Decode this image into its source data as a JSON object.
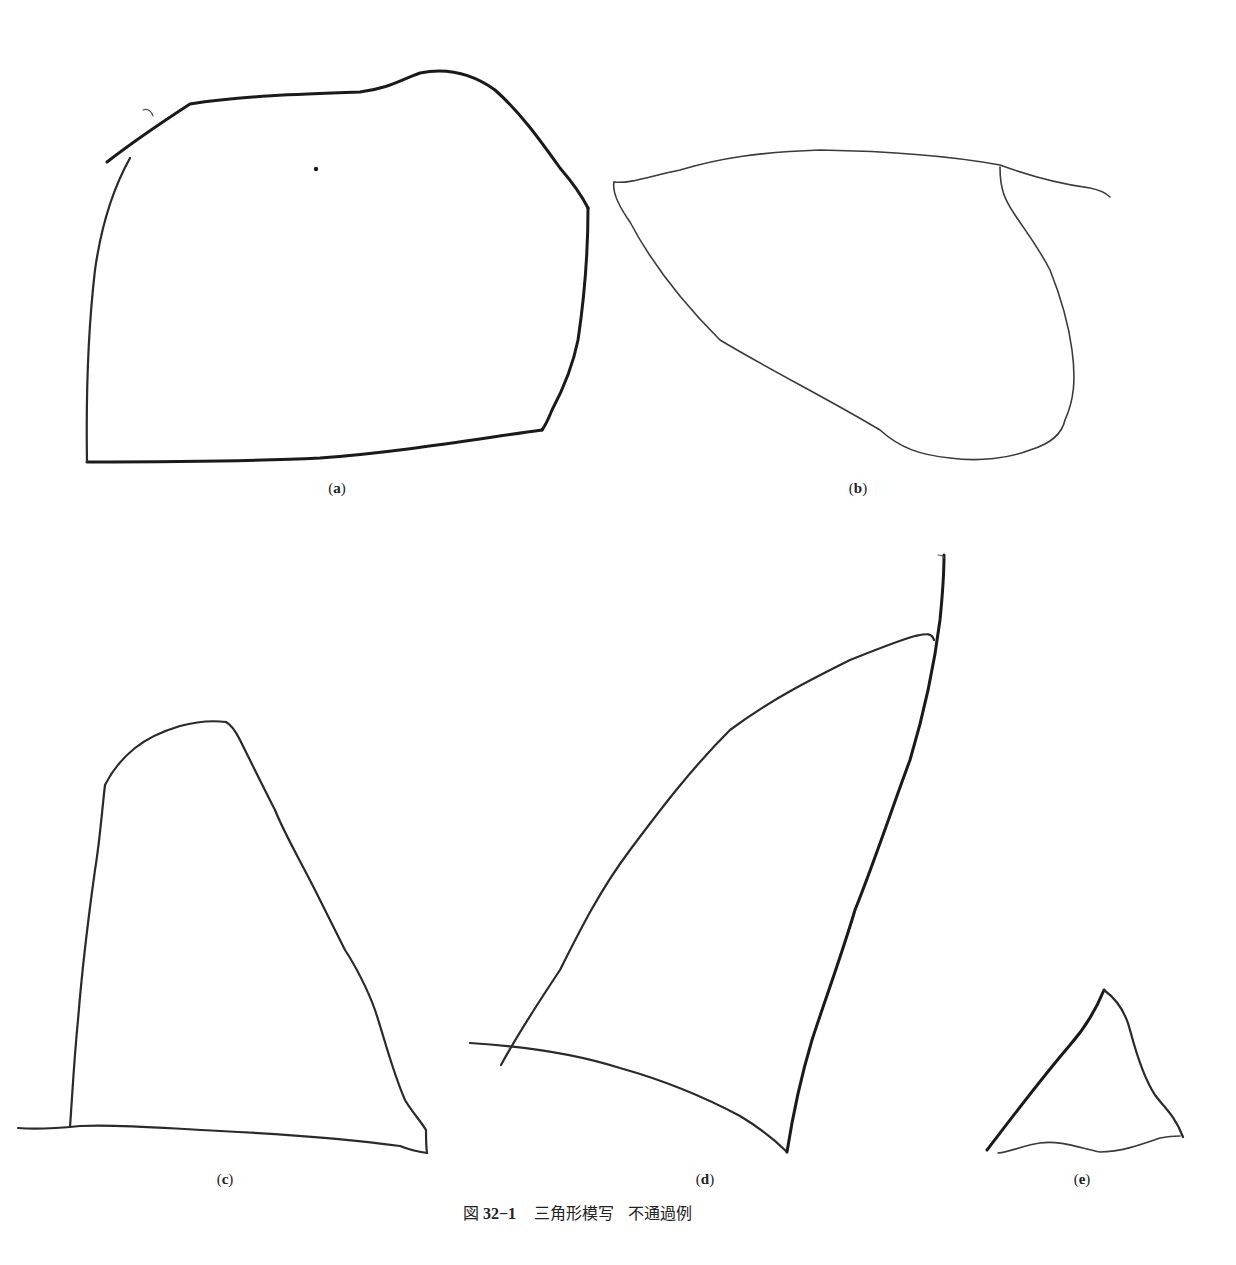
{
  "figure": {
    "caption": {
      "prefix": "図",
      "number": "32−1",
      "title": "三角形模写",
      "subtitle": "不通過例"
    },
    "panels": [
      {
        "id": "a",
        "open": "(",
        "letter": "a",
        "close": ")",
        "description": "Pentagon-like closed shape instead of triangle; top stroke overshoots at left"
      },
      {
        "id": "b",
        "open": "(",
        "letter": "b",
        "close": ")",
        "description": "Leaf/teardrop shape with top line extending past right vertex"
      },
      {
        "id": "c",
        "open": "(",
        "letter": "c",
        "close": ")",
        "description": "Quadrilateral with rounded top and baseline extending past left side"
      },
      {
        "id": "d",
        "open": "(",
        "letter": "d",
        "close": ")",
        "description": "Curved fin-like shape with lines overshooting at corners"
      },
      {
        "id": "e",
        "open": "(",
        "letter": "e",
        "close": ")",
        "description": "Small triangle with wavy, disconnected base"
      }
    ]
  },
  "colors": {
    "ink": "#1a1a1a",
    "background": "#ffffff"
  }
}
